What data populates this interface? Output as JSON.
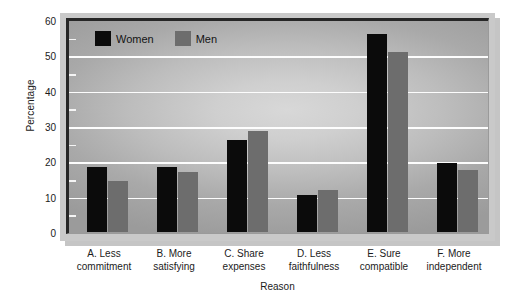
{
  "chart_data": {
    "type": "bar",
    "title": "",
    "xlabel": "Reason",
    "ylabel": "Percentage",
    "categories": [
      "A. Less\ncommitment",
      "B. More\nsatisfying",
      "C. Share\nexpenses",
      "D. Less\nfaithfulness",
      "E. Sure\ncompatible",
      "F. More\nindependent"
    ],
    "category_lines": [
      [
        "A. Less",
        "commitment"
      ],
      [
        "B. More",
        "satisfying"
      ],
      [
        "C. Share",
        "expenses"
      ],
      [
        "D. Less",
        "faithfulness"
      ],
      [
        "E. Sure",
        "compatible"
      ],
      [
        "F. More",
        "independent"
      ]
    ],
    "series": [
      {
        "name": "Women",
        "color": "#0b0b0b",
        "values": [
          18.3,
          18.5,
          26.0,
          10.5,
          56.0,
          19.5
        ]
      },
      {
        "name": "Men",
        "color": "#6d6d6d",
        "values": [
          14.3,
          17.0,
          28.5,
          12.0,
          51.0,
          17.5
        ]
      }
    ],
    "ylim": [
      0,
      60
    ],
    "yticks": [
      0,
      10,
      20,
      30,
      40,
      50,
      60
    ],
    "ytick_labels": [
      "0",
      "10",
      "20",
      "30",
      "40",
      "50",
      "60"
    ],
    "yminor_ticks": [
      5,
      15,
      25,
      35,
      45,
      55
    ],
    "grid": "horizontal",
    "legend_position": "top-left"
  },
  "legend": {
    "entries": [
      {
        "label": "Women",
        "color": "#0b0b0b"
      },
      {
        "label": "Men",
        "color": "#6d6d6d"
      }
    ]
  }
}
